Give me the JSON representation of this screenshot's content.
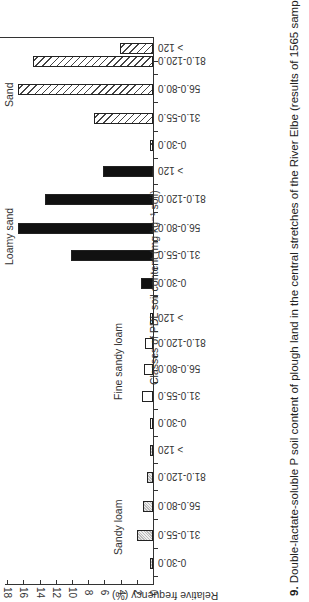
{
  "chart_data": {
    "type": "bar",
    "orientation": "rotated page (horizontal bars, page rotated 90 degrees)",
    "title": "9. Double-lactate-soluble P soil content of plough land in the central stretches of the River Elbe (results of 1565 samples of topsoil)",
    "xlabel": "Classes of PDL soil content (mg kg⁻¹ soil)",
    "ylabel": "Relative frequency (%)",
    "ylim": [
      0,
      18
    ],
    "yticks": [
      0,
      2,
      4,
      6,
      8,
      10,
      12,
      14,
      16,
      18
    ],
    "categories": [
      "0-30.0",
      "31.0-55.0",
      "56.0-80.0",
      "81.0-120.0",
      "> 120"
    ],
    "series": [
      {
        "name": "Sandy loam",
        "pattern": "dotted",
        "values": [
          0.4,
          2.0,
          1.2,
          0.8,
          0.2
        ]
      },
      {
        "name": "Fine sandy loam",
        "pattern": "open",
        "values": [
          0.3,
          1.3,
          1.1,
          1.0,
          0.3
        ]
      },
      {
        "name": "Loamy sand",
        "pattern": "solid",
        "values": [
          1.5,
          10.1,
          16.7,
          13.3,
          6.2
        ]
      },
      {
        "name": "Sand",
        "pattern": "hatched",
        "values": [
          0.2,
          7.3,
          16.7,
          14.8,
          4.1
        ]
      }
    ],
    "grid": false,
    "legend": "group labels placed beside each group"
  },
  "labels": {
    "caption_num": "9.",
    "caption_text": " Double-lactate-soluble P soil content of plough land in the central stretches of the River Elbe (results of 1565 samples of topsoil)",
    "xlabel": "Classes of PDL soil content (mg kg⁻¹ soil)",
    "ylabel": "Relative frequency (%)",
    "groups": [
      "Sandy loam",
      "Fine sandy loam",
      "Loamy sand",
      "Sand"
    ],
    "ticks": [
      "0",
      "2",
      "4",
      "6",
      "8",
      "10",
      "12",
      "14",
      "16",
      "18"
    ],
    "cats": [
      "0-30.0",
      "31.0-55.0",
      "56.0-80.0",
      "81.0-120.0",
      "> 120"
    ]
  }
}
